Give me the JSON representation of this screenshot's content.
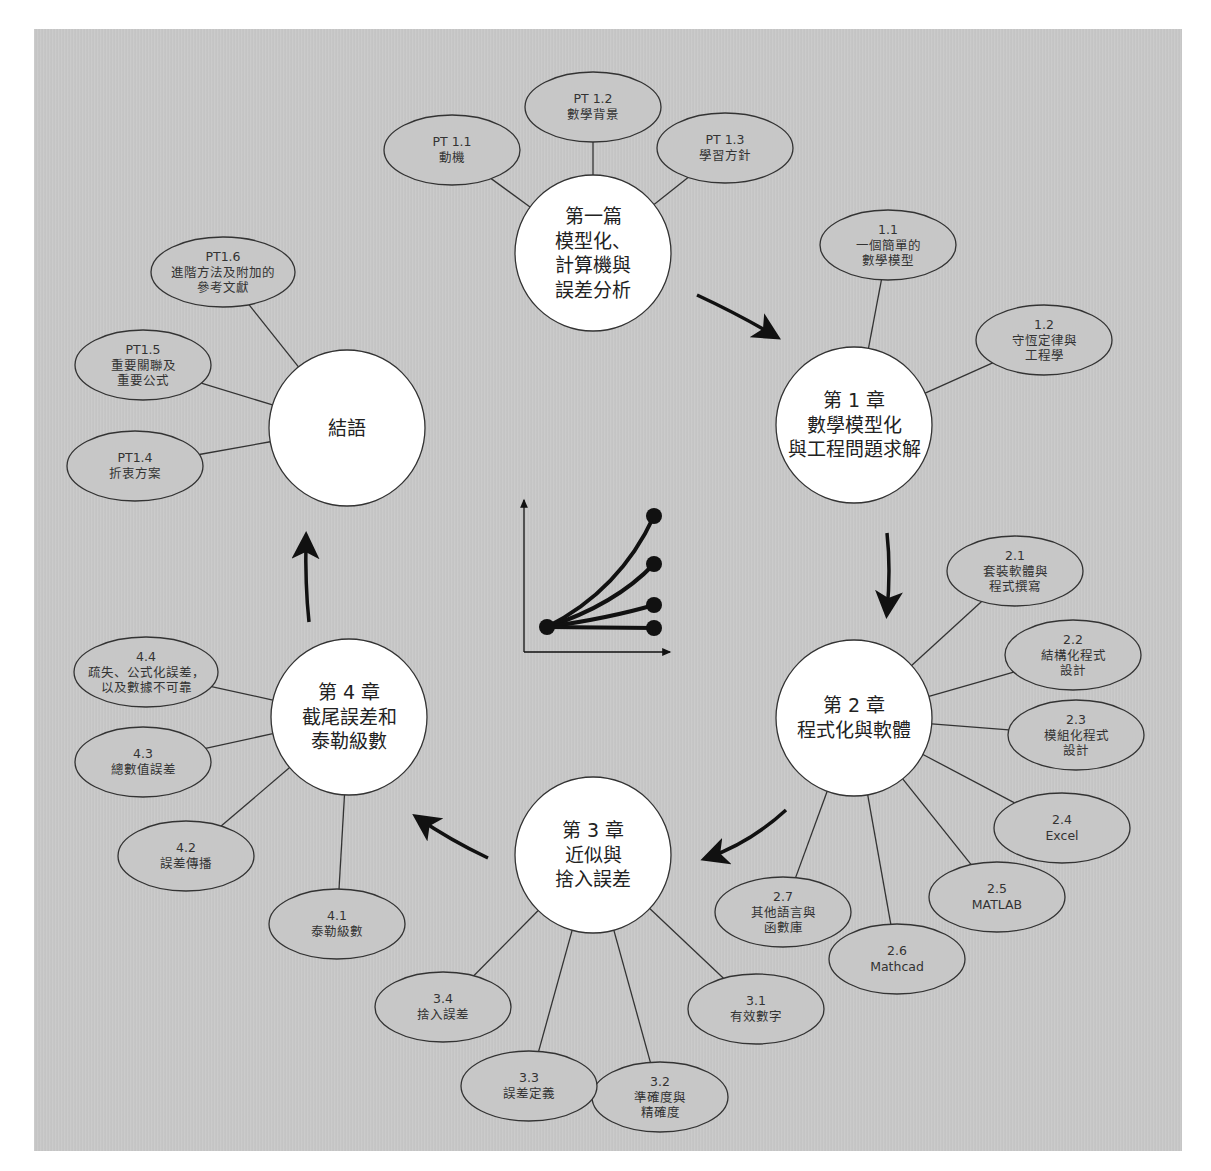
{
  "colors": {
    "panel_bg": "#c7c7c7",
    "node_fill": "#ffffff",
    "subtopic_fill": "#c7c7c7",
    "stroke": "#333333",
    "arrow": "#111111"
  },
  "hubs": [
    {
      "id": "part1",
      "lines": [
        "第一篇",
        "模型化、",
        "計算機與",
        "誤差分析"
      ],
      "cx": 593,
      "cy": 253,
      "r": 78
    },
    {
      "id": "ch1",
      "lines": [
        "第 1 章",
        "數學模型化",
        "與工程問題求解"
      ],
      "cx": 854,
      "cy": 425,
      "r": 78
    },
    {
      "id": "ch2",
      "lines": [
        "第 2 章",
        "程式化與軟體"
      ],
      "cx": 854,
      "cy": 718,
      "r": 78
    },
    {
      "id": "ch3",
      "lines": [
        "第 3 章",
        "近似與",
        "捨入誤差"
      ],
      "cx": 593,
      "cy": 855,
      "r": 78
    },
    {
      "id": "ch4",
      "lines": [
        "第 4 章",
        "截尾誤差和",
        "泰勒級數"
      ],
      "cx": 349,
      "cy": 717,
      "r": 78
    },
    {
      "id": "epilogue",
      "lines": [
        "結語"
      ],
      "cx": 347,
      "cy": 428,
      "r": 78
    }
  ],
  "subtopics": [
    {
      "hub": "part1",
      "num": "PT 1.1",
      "lines": [
        "動機"
      ],
      "cx": 452,
      "cy": 150
    },
    {
      "hub": "part1",
      "num": "PT 1.2",
      "lines": [
        "數學背景"
      ],
      "cx": 593,
      "cy": 107
    },
    {
      "hub": "part1",
      "num": "PT 1.3",
      "lines": [
        "學習方針"
      ],
      "cx": 725,
      "cy": 148
    },
    {
      "hub": "ch1",
      "num": "1.1",
      "lines": [
        "一個簡單的",
        "數學模型"
      ],
      "cx": 888,
      "cy": 245
    },
    {
      "hub": "ch1",
      "num": "1.2",
      "lines": [
        "守恆定律與",
        "工程學"
      ],
      "cx": 1044,
      "cy": 340
    },
    {
      "hub": "ch2",
      "num": "2.1",
      "lines": [
        "套裝軟體與",
        "程式撰寫"
      ],
      "cx": 1015,
      "cy": 571
    },
    {
      "hub": "ch2",
      "num": "2.2",
      "lines": [
        "結構化程式",
        "設計"
      ],
      "cx": 1073,
      "cy": 655
    },
    {
      "hub": "ch2",
      "num": "2.3",
      "lines": [
        "模組化程式",
        "設計"
      ],
      "cx": 1076,
      "cy": 735
    },
    {
      "hub": "ch2",
      "num": "2.4",
      "lines": [
        "Excel"
      ],
      "cx": 1062,
      "cy": 828
    },
    {
      "hub": "ch2",
      "num": "2.5",
      "lines": [
        "MATLAB"
      ],
      "cx": 997,
      "cy": 897
    },
    {
      "hub": "ch2",
      "num": "2.6",
      "lines": [
        "Mathcad"
      ],
      "cx": 897,
      "cy": 959
    },
    {
      "hub": "ch2",
      "num": "2.7",
      "lines": [
        "其他語言與",
        "函數庫"
      ],
      "cx": 783,
      "cy": 912
    },
    {
      "hub": "ch3",
      "num": "3.1",
      "lines": [
        "有效數字"
      ],
      "cx": 756,
      "cy": 1009
    },
    {
      "hub": "ch3",
      "num": "3.2",
      "lines": [
        "準確度與",
        "精確度"
      ],
      "cx": 660,
      "cy": 1097
    },
    {
      "hub": "ch3",
      "num": "3.3",
      "lines": [
        "誤差定義"
      ],
      "cx": 529,
      "cy": 1086
    },
    {
      "hub": "ch3",
      "num": "3.4",
      "lines": [
        "捨入誤差"
      ],
      "cx": 443,
      "cy": 1007
    },
    {
      "hub": "ch4",
      "num": "4.1",
      "lines": [
        "泰勒級數"
      ],
      "cx": 337,
      "cy": 924
    },
    {
      "hub": "ch4",
      "num": "4.2",
      "lines": [
        "誤差傳播"
      ],
      "cx": 186,
      "cy": 856
    },
    {
      "hub": "ch4",
      "num": "4.3",
      "lines": [
        "總數值誤差"
      ],
      "cx": 143,
      "cy": 762
    },
    {
      "hub": "ch4",
      "num": "4.4",
      "lines": [
        "疏失、公式化誤差，",
        "以及數據不可靠"
      ],
      "cx": 146,
      "cy": 672
    },
    {
      "hub": "epilogue",
      "num": "PT1.4",
      "lines": [
        "折衷方案"
      ],
      "cx": 135,
      "cy": 466
    },
    {
      "hub": "epilogue",
      "num": "PT1.5",
      "lines": [
        "重要關聯及",
        "重要公式"
      ],
      "cx": 143,
      "cy": 365
    },
    {
      "hub": "epilogue",
      "num": "PT1.6",
      "lines": [
        "進階方法及附加的",
        "參考文獻"
      ],
      "cx": 223,
      "cy": 272
    }
  ],
  "flow_arrows": [
    {
      "from": "part1",
      "to": "ch1"
    },
    {
      "from": "ch1",
      "to": "ch2"
    },
    {
      "from": "ch2",
      "to": "ch3"
    },
    {
      "from": "ch3",
      "to": "ch4"
    },
    {
      "from": "ch4",
      "to": "epilogue"
    }
  ],
  "center_icon": {
    "name": "convergence-curves-icon",
    "curve_count": 4
  }
}
